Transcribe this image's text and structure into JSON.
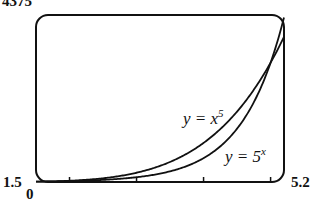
{
  "chart_data": {
    "type": "line",
    "title": "",
    "xlabel": "",
    "ylabel": "",
    "xlim": [
      1.5,
      5.2
    ],
    "ylim": [
      0,
      4375
    ],
    "x_ticks": [
      2,
      3,
      4,
      5
    ],
    "grid": false,
    "series": [
      {
        "name": "y = x^5",
        "function": "x^5",
        "x": [
          1.5,
          2,
          2.5,
          3,
          3.5,
          4,
          4.5,
          5,
          5.2
        ],
        "values": [
          7.6,
          32,
          97.7,
          243,
          525.2,
          1024,
          1845.3,
          3125,
          3802
        ]
      },
      {
        "name": "y = 5^x",
        "function": "5^x",
        "x": [
          1.5,
          2,
          2.5,
          3,
          3.5,
          4,
          4.5,
          5,
          5.2
        ],
        "values": [
          11.2,
          25,
          55.9,
          125,
          279.5,
          625,
          1397.5,
          3125,
          4308.5
        ]
      }
    ],
    "annotations": [
      "y = x^5",
      "y = 5^x"
    ]
  },
  "labels": {
    "ymax": "4375",
    "xmin": "1.5",
    "ymin": "0",
    "xmax": "5.2",
    "eq1_lhs": "y = x",
    "eq1_exp": "5",
    "eq2_lhs": "y = 5",
    "eq2_exp": "x"
  }
}
